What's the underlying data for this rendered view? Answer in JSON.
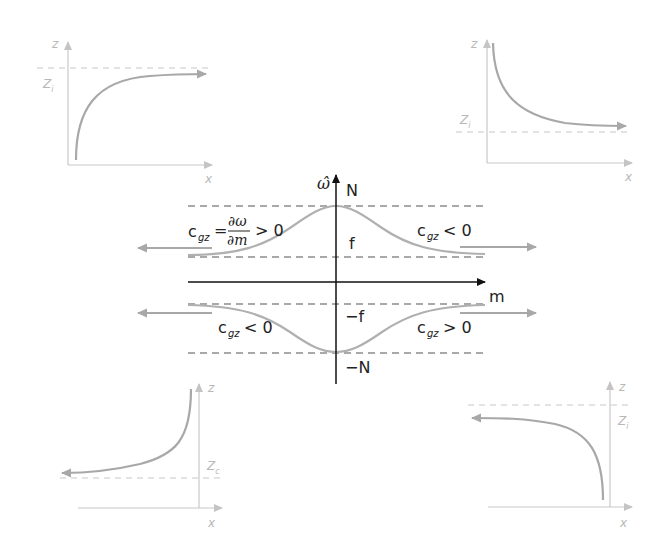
{
  "diagram": {
    "type": "dispersion-relation-with-ray-paths",
    "colors": {
      "axis_main": "#111111",
      "curve": "#b0b0b0",
      "inset_axis": "#c8c8c8",
      "inset_curve": "#a8a8a8",
      "dashed": "#555555",
      "inset_dashed": "#c8c8c8",
      "inset_text": "#b8b8b8"
    },
    "central_plot": {
      "y_axis_label": "ω̂",
      "x_axis_label": "m",
      "levels": {
        "top": "N",
        "upper": "f",
        "lower": "−f",
        "bottom": "−N"
      },
      "annotations": {
        "upper_left_c": "c",
        "upper_left_sub": "gz",
        "upper_left_eq": "=",
        "upper_left_num": "∂ω",
        "upper_left_den": "∂m",
        "upper_left_rel": "> 0",
        "upper_right_c": "c",
        "upper_right_sub": "gz",
        "upper_right_rel": "< 0",
        "lower_left_c": "c",
        "lower_left_sub": "gz",
        "lower_left_rel": "< 0",
        "lower_right_c": "c",
        "lower_right_sub": "gz",
        "lower_right_rel": "> 0"
      }
    },
    "insets": {
      "top_left": {
        "z_label": "z",
        "x_label": "x",
        "level_label": "Z",
        "level_sub": "i",
        "curve": "rises from bottom, approaches Z_i from below, arrow to right"
      },
      "top_right": {
        "z_label": "z",
        "x_label": "x",
        "level_label": "Z",
        "level_sub": "i",
        "curve": "descends from top, approaches Z_i from above, arrow to right"
      },
      "bottom_left": {
        "z_label": "z",
        "x_label": "x",
        "level_label": "Z",
        "level_sub": "c",
        "curve": "descends from top near axis, approaches Z_c from above, arrow to left"
      },
      "bottom_right": {
        "z_label": "z",
        "x_label": "x",
        "level_label": "Z",
        "level_sub": "i",
        "curve": "rises from bottom near axis, approaches Z_i from below, arrow to left"
      }
    }
  }
}
